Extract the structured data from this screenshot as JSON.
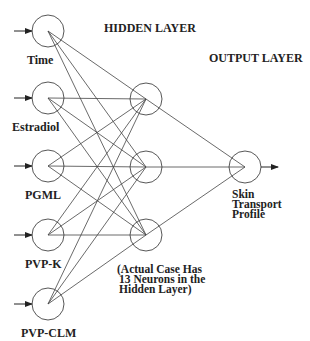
{
  "titles": {
    "hidden_layer": "HIDDEN LAYER",
    "output_layer": "OUTPUT LAYER"
  },
  "inputs": [
    {
      "label": "Time"
    },
    {
      "label": "Estradiol"
    },
    {
      "label": "PGML"
    },
    {
      "label": "PVP-K"
    },
    {
      "label": "PVP-CLM"
    }
  ],
  "hidden_nodes": 3,
  "output": {
    "label_lines": [
      "Skin",
      "Transport",
      "Profile"
    ]
  },
  "note": {
    "lines": [
      "(Actual Case Has",
      "13 Neurons in the",
      "Hidden Layer)"
    ]
  },
  "colors": {
    "stroke": "#333333",
    "text": "#222222"
  }
}
